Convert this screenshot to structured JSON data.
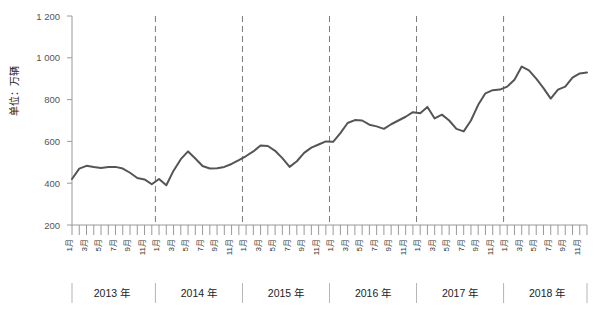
{
  "chart_data": {
    "type": "line",
    "title": "",
    "subtitle": "",
    "xlabel": "",
    "ylabel": "单位：万辆",
    "ylim": [
      200,
      1200
    ],
    "yticks": [
      "200",
      "400",
      "600",
      "800",
      "1 000",
      "1 200"
    ],
    "ytick_values": [
      200,
      400,
      600,
      800,
      1000,
      1200
    ],
    "grid": false,
    "legend": "none",
    "line_color": "#555555",
    "month_tick_labels": [
      "1月",
      "",
      "3月",
      "",
      "5月",
      "",
      "7月",
      "",
      "9月",
      "",
      "11月",
      ""
    ],
    "month_labels_all": [
      "1月",
      "2月",
      "3月",
      "4月",
      "5月",
      "6月",
      "7月",
      "8月",
      "9月",
      "10月",
      "11月",
      "12月"
    ],
    "year_groups": [
      {
        "label": "2013 年",
        "year": 2013
      },
      {
        "label": "2014 年",
        "year": 2014
      },
      {
        "label": "2015 年",
        "year": 2015
      },
      {
        "label": "2016 年",
        "year": 2016
      },
      {
        "label": "2017 年",
        "year": 2017
      },
      {
        "label": "2018 年",
        "year": 2018
      }
    ],
    "series": [
      {
        "name": "月度销量",
        "color": "#555555",
        "points": [
          {
            "x": "2013-01",
            "y": 420
          },
          {
            "x": "2013-02",
            "y": 470
          },
          {
            "x": "2013-03",
            "y": 483
          },
          {
            "x": "2013-04",
            "y": 477
          },
          {
            "x": "2013-05",
            "y": 473
          },
          {
            "x": "2013-06",
            "y": 477
          },
          {
            "x": "2013-07",
            "y": 478
          },
          {
            "x": "2013-08",
            "y": 470
          },
          {
            "x": "2013-09",
            "y": 450
          },
          {
            "x": "2013-10",
            "y": 425
          },
          {
            "x": "2013-11",
            "y": 418
          },
          {
            "x": "2013-12",
            "y": 395
          },
          {
            "x": "2014-01",
            "y": 420
          },
          {
            "x": "2014-02",
            "y": 390
          },
          {
            "x": "2014-03",
            "y": 460
          },
          {
            "x": "2014-04",
            "y": 515
          },
          {
            "x": "2014-05",
            "y": 552
          },
          {
            "x": "2014-06",
            "y": 518
          },
          {
            "x": "2014-07",
            "y": 482
          },
          {
            "x": "2014-08",
            "y": 470
          },
          {
            "x": "2014-09",
            "y": 472
          },
          {
            "x": "2014-10",
            "y": 478
          },
          {
            "x": "2014-11",
            "y": 492
          },
          {
            "x": "2014-12",
            "y": 510
          },
          {
            "x": "2015-01",
            "y": 530
          },
          {
            "x": "2015-02",
            "y": 552
          },
          {
            "x": "2015-03",
            "y": 580
          },
          {
            "x": "2015-04",
            "y": 578
          },
          {
            "x": "2015-05",
            "y": 555
          },
          {
            "x": "2015-06",
            "y": 520
          },
          {
            "x": "2015-07",
            "y": 478
          },
          {
            "x": "2015-08",
            "y": 505
          },
          {
            "x": "2015-09",
            "y": 545
          },
          {
            "x": "2015-10",
            "y": 570
          },
          {
            "x": "2015-11",
            "y": 585
          },
          {
            "x": "2015-12",
            "y": 600
          },
          {
            "x": "2016-01",
            "y": 598
          },
          {
            "x": "2016-02",
            "y": 640
          },
          {
            "x": "2016-03",
            "y": 688
          },
          {
            "x": "2016-04",
            "y": 702
          },
          {
            "x": "2016-05",
            "y": 700
          },
          {
            "x": "2016-06",
            "y": 680
          },
          {
            "x": "2016-07",
            "y": 672
          },
          {
            "x": "2016-08",
            "y": 660
          },
          {
            "x": "2016-09",
            "y": 682
          },
          {
            "x": "2016-10",
            "y": 700
          },
          {
            "x": "2016-11",
            "y": 718
          },
          {
            "x": "2016-12",
            "y": 740
          },
          {
            "x": "2017-01",
            "y": 735
          },
          {
            "x": "2017-02",
            "y": 765
          },
          {
            "x": "2017-03",
            "y": 710
          },
          {
            "x": "2017-04",
            "y": 728
          },
          {
            "x": "2017-05",
            "y": 700
          },
          {
            "x": "2017-06",
            "y": 660
          },
          {
            "x": "2017-07",
            "y": 648
          },
          {
            "x": "2017-08",
            "y": 700
          },
          {
            "x": "2017-09",
            "y": 775
          },
          {
            "x": "2017-10",
            "y": 830
          },
          {
            "x": "2017-11",
            "y": 845
          },
          {
            "x": "2017-12",
            "y": 848
          },
          {
            "x": "2018-01",
            "y": 862
          },
          {
            "x": "2018-02",
            "y": 895
          },
          {
            "x": "2018-03",
            "y": 958
          },
          {
            "x": "2018-04",
            "y": 940
          },
          {
            "x": "2018-05",
            "y": 900
          },
          {
            "x": "2018-06",
            "y": 855
          },
          {
            "x": "2018-07",
            "y": 805
          },
          {
            "x": "2018-08",
            "y": 848
          },
          {
            "x": "2018-09",
            "y": 862
          },
          {
            "x": "2018-10",
            "y": 905
          },
          {
            "x": "2018-11",
            "y": 925
          },
          {
            "x": "2018-12",
            "y": 930
          }
        ]
      }
    ]
  }
}
